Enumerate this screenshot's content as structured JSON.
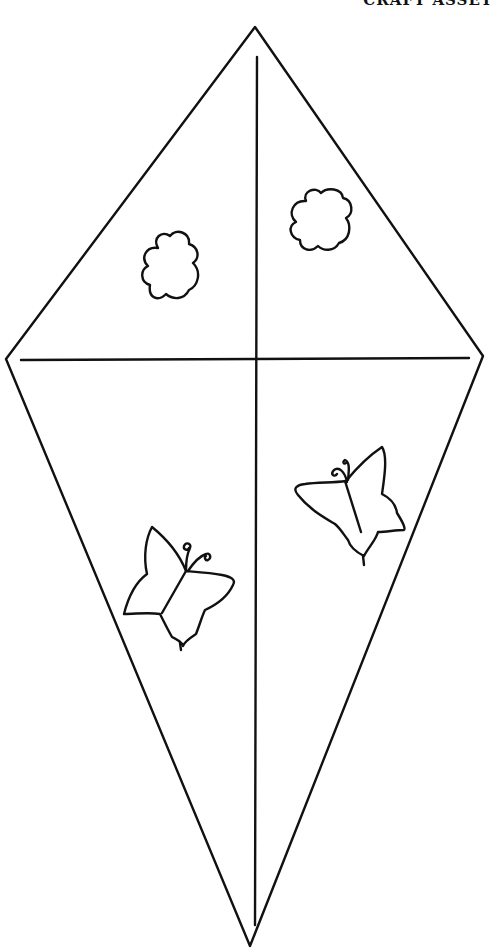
{
  "header": {
    "clipped_text": "CRAFT ASSET"
  },
  "colors": {
    "background": "#ffffff",
    "stroke": "#111111"
  },
  "kite": {
    "vertices": {
      "top": [
        255,
        27
      ],
      "right": [
        483,
        356
      ],
      "bottom": [
        250,
        946
      ],
      "left": [
        6,
        359
      ]
    },
    "spar_vertical": [
      [
        257,
        57
      ],
      [
        255,
        925
      ]
    ],
    "spar_horizontal": [
      [
        21,
        360
      ],
      [
        469,
        358
      ]
    ]
  },
  "decorations": [
    {
      "type": "flower",
      "label": "flower-left",
      "center": [
        170,
        270
      ]
    },
    {
      "type": "flower",
      "label": "flower-right",
      "center": [
        320,
        222
      ]
    },
    {
      "type": "butterfly",
      "label": "butterfly-right",
      "center": [
        350,
        500
      ]
    },
    {
      "type": "butterfly",
      "label": "butterfly-left",
      "center": [
        180,
        585
      ]
    }
  ]
}
